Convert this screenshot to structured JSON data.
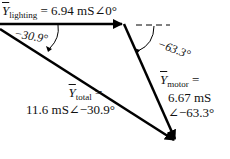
{
  "phasors": {
    "lighting": {
      "symbol": "Y",
      "subscript": "lighting",
      "equals": "=",
      "value": "6.94 mS∠0°"
    },
    "motor": {
      "symbol": "Y",
      "subscript": "motor",
      "equals": "=",
      "magnitude": "6.67 mS",
      "angle": "∠−63.3°"
    },
    "total": {
      "symbol": "Y",
      "subscript": "total",
      "equals": "=",
      "value": "11.6 mS∠−30.9°"
    }
  },
  "angle_labels": {
    "total_angle": "−30.9°",
    "motor_angle": "−63.3°"
  }
}
